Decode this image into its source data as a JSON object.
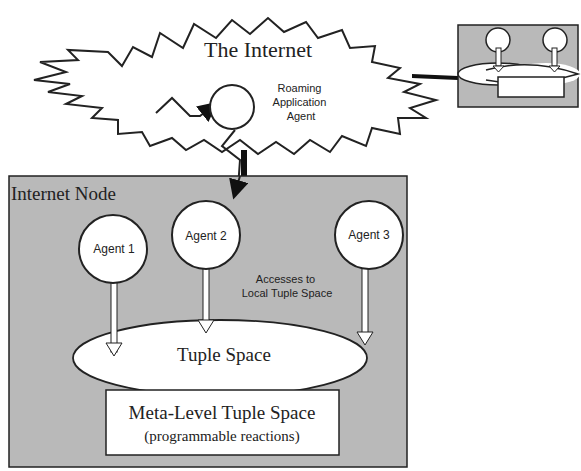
{
  "internet": {
    "title": "The Internet",
    "roaming_agent_label_lines": [
      "Roaming",
      "Application",
      "Agent"
    ]
  },
  "node": {
    "title": "Internet Node",
    "agents": [
      {
        "label": "Agent 1"
      },
      {
        "label": "Agent 2"
      },
      {
        "label": "Agent 3"
      }
    ],
    "access_label_lines": [
      "Accesses to",
      "Local Tuple Space"
    ],
    "tuple_space_label": "Tuple Space",
    "meta_title": "Meta-Level Tuple Space",
    "meta_subtitle": "(programmable reactions)"
  },
  "colors": {
    "node_fill": "#b9b9b9",
    "stroke": "#222222",
    "white": "#ffffff"
  }
}
